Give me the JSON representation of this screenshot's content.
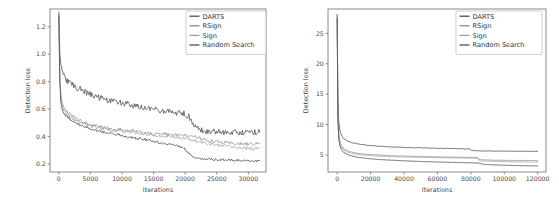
{
  "figure": {
    "background": "#ffffff",
    "panels": [
      "left",
      "right"
    ]
  },
  "chart_data": [
    {
      "id": "left",
      "type": "line",
      "title": "",
      "xlabel": "Iterations",
      "ylabel": "Detection loss",
      "xlim": [
        -1400,
        32800
      ],
      "ylim": [
        0.14,
        1.33
      ],
      "xticks": [
        0,
        5000,
        10000,
        15000,
        20000,
        25000,
        30000
      ],
      "xticklabels": [
        "0",
        "5000",
        "10000",
        "15000",
        "20000",
        "25000",
        "30000"
      ],
      "yticks": [
        0.2,
        0.4,
        0.6,
        0.8,
        1.0,
        1.2
      ],
      "yticklabels": [
        "0.2",
        "0.4",
        "0.6",
        "0.8",
        "1.0",
        "1.2"
      ],
      "grid": false,
      "legend_position": "upper right",
      "legend_labels": [
        "DARTS",
        "RSign",
        "Sign",
        "Random Search"
      ],
      "series": [
        {
          "name": "DARTS",
          "color": "#4a4a4a",
          "linewidth": 0.75,
          "noise": 0.022,
          "x": [
            0,
            150,
            300,
            500,
            800,
            1200,
            1800,
            2500,
            3400,
            4400,
            5500,
            6800,
            8200,
            9600,
            11000,
            12500,
            14000,
            15500,
            17000,
            18500,
            19800,
            20600,
            21500,
            22500,
            24000,
            26000,
            28000,
            30000,
            31800
          ],
          "y": [
            1.31,
            1.02,
            0.93,
            0.88,
            0.84,
            0.81,
            0.79,
            0.765,
            0.745,
            0.72,
            0.695,
            0.675,
            0.655,
            0.645,
            0.635,
            0.615,
            0.6,
            0.595,
            0.585,
            0.575,
            0.565,
            0.545,
            0.475,
            0.445,
            0.435,
            0.43,
            0.43,
            0.43,
            0.432
          ]
        },
        {
          "name": "RSign",
          "color": "#8a8a8a",
          "linewidth": 0.7,
          "noise": 0.013,
          "x": [
            0,
            150,
            300,
            500,
            800,
            1200,
            1800,
            2500,
            3400,
            4400,
            5500,
            6800,
            8200,
            9600,
            11000,
            12500,
            14000,
            15500,
            17000,
            18500,
            20000,
            21500,
            23000,
            25000,
            27000,
            29000,
            31000,
            31800
          ],
          "y": [
            1.3,
            0.86,
            0.72,
            0.655,
            0.615,
            0.585,
            0.56,
            0.535,
            0.515,
            0.495,
            0.48,
            0.465,
            0.455,
            0.45,
            0.445,
            0.435,
            0.425,
            0.415,
            0.415,
            0.41,
            0.405,
            0.395,
            0.375,
            0.36,
            0.35,
            0.345,
            0.345,
            0.35
          ]
        },
        {
          "name": "Sign",
          "color": "#9d9d9d",
          "linewidth": 0.7,
          "noise": 0.012,
          "x": [
            0,
            150,
            300,
            500,
            800,
            1200,
            1800,
            2500,
            3400,
            4400,
            5500,
            6800,
            8200,
            9600,
            11000,
            12500,
            14000,
            15500,
            17000,
            18500,
            20000,
            21500,
            23000,
            25000,
            27000,
            29000,
            31000,
            31800
          ],
          "y": [
            1.29,
            0.82,
            0.69,
            0.63,
            0.59,
            0.565,
            0.54,
            0.52,
            0.5,
            0.485,
            0.47,
            0.455,
            0.445,
            0.44,
            0.435,
            0.425,
            0.415,
            0.405,
            0.4,
            0.395,
            0.385,
            0.37,
            0.355,
            0.335,
            0.325,
            0.315,
            0.31,
            0.315
          ]
        },
        {
          "name": "Random Search",
          "color": "#4f4f4f",
          "linewidth": 0.8,
          "noise": 0.009,
          "x": [
            0,
            150,
            300,
            500,
            800,
            1200,
            1800,
            2500,
            3400,
            4400,
            5500,
            6800,
            8200,
            9600,
            11000,
            12500,
            14000,
            15500,
            17000,
            18500,
            19800,
            20600,
            21300,
            22500,
            24000,
            26000,
            28000,
            30000,
            31800
          ],
          "y": [
            1.28,
            0.8,
            0.66,
            0.6,
            0.565,
            0.545,
            0.525,
            0.5,
            0.48,
            0.465,
            0.45,
            0.435,
            0.42,
            0.41,
            0.395,
            0.385,
            0.375,
            0.36,
            0.345,
            0.335,
            0.315,
            0.275,
            0.245,
            0.238,
            0.232,
            0.228,
            0.225,
            0.222,
            0.222
          ]
        }
      ]
    },
    {
      "id": "right",
      "type": "line",
      "title": "",
      "xlabel": "Iterations",
      "ylabel": "Detection loss",
      "xlim": [
        -5500,
        125000
      ],
      "ylim": [
        2.2,
        29.0
      ],
      "xticks": [
        0,
        20000,
        40000,
        60000,
        80000,
        100000,
        120000
      ],
      "xticklabels": [
        "0",
        "20000",
        "40000",
        "60000",
        "80000",
        "100000",
        "120000"
      ],
      "yticks": [
        5,
        10,
        15,
        20,
        25
      ],
      "yticklabels": [
        "5",
        "10",
        "15",
        "20",
        "25"
      ],
      "grid": false,
      "legend_position": "upper right",
      "legend_labels": [
        "DARTS",
        "RSign",
        "Sign",
        "Random Search"
      ],
      "series": [
        {
          "name": "DARTS",
          "color": "#4a4a4a",
          "linewidth": 0.8,
          "noise": 0.03,
          "x": [
            0,
            400,
            900,
            1600,
            2600,
            4000,
            6000,
            9000,
            13000,
            18000,
            24000,
            31000,
            39000,
            48000,
            57000,
            66000,
            74000,
            79500,
            80500,
            86000,
            95000,
            105000,
            115000,
            120000
          ],
          "y": [
            28.2,
            14.5,
            10.6,
            9.0,
            8.2,
            7.7,
            7.3,
            7.0,
            6.8,
            6.6,
            6.45,
            6.35,
            6.25,
            6.18,
            6.12,
            6.08,
            6.03,
            6.0,
            5.72,
            5.68,
            5.64,
            5.62,
            5.6,
            5.6
          ]
        },
        {
          "name": "RSign",
          "color": "#8a8a8a",
          "linewidth": 0.75,
          "noise": 0.025,
          "x": [
            0,
            400,
            900,
            1600,
            2600,
            4000,
            6000,
            9000,
            13000,
            18000,
            24000,
            31000,
            39000,
            48000,
            57000,
            66000,
            74000,
            80000,
            84000,
            85500,
            92000,
            100000,
            110000,
            120000
          ],
          "y": [
            27.9,
            12.2,
            8.6,
            7.2,
            6.5,
            6.0,
            5.7,
            5.45,
            5.25,
            5.1,
            5.0,
            4.9,
            4.82,
            4.76,
            4.7,
            4.66,
            4.63,
            4.6,
            4.58,
            4.22,
            4.16,
            4.12,
            4.1,
            4.08
          ]
        },
        {
          "name": "Sign",
          "color": "#9d9d9d",
          "linewidth": 0.75,
          "noise": 0.025,
          "x": [
            0,
            400,
            900,
            1600,
            2600,
            4000,
            6000,
            9000,
            13000,
            18000,
            24000,
            31000,
            39000,
            48000,
            57000,
            66000,
            74000,
            80000,
            84000,
            85500,
            92000,
            100000,
            110000,
            120000
          ],
          "y": [
            27.7,
            11.6,
            8.2,
            6.9,
            6.25,
            5.8,
            5.5,
            5.25,
            5.05,
            4.92,
            4.82,
            4.74,
            4.68,
            4.62,
            4.57,
            4.53,
            4.5,
            4.48,
            4.45,
            4.02,
            3.95,
            3.9,
            3.86,
            3.84
          ]
        },
        {
          "name": "Random Search",
          "color": "#4f4f4f",
          "linewidth": 0.8,
          "noise": 0.02,
          "x": [
            0,
            400,
            900,
            1600,
            2600,
            4000,
            6000,
            9000,
            13000,
            18000,
            24000,
            31000,
            39000,
            48000,
            57000,
            66000,
            74000,
            80000,
            85000,
            88000,
            95000,
            105000,
            115000,
            120000
          ],
          "y": [
            27.5,
            10.8,
            7.7,
            6.5,
            5.85,
            5.4,
            5.1,
            4.82,
            4.6,
            4.42,
            4.28,
            4.16,
            4.05,
            3.95,
            3.87,
            3.8,
            3.74,
            3.7,
            3.66,
            3.45,
            3.35,
            3.28,
            3.22,
            3.2
          ]
        }
      ]
    }
  ]
}
